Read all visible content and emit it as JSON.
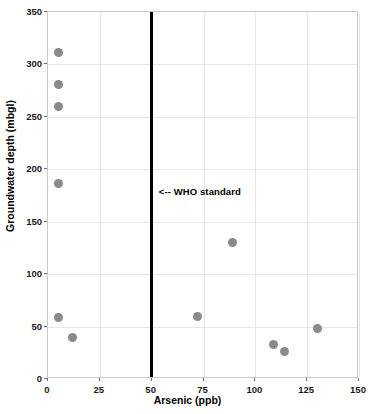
{
  "chart_data": {
    "type": "scatter",
    "title": "",
    "xlabel": "Arsenic (ppb)",
    "ylabel": "Groundwater depth (mbgl)",
    "xlim": [
      0,
      150
    ],
    "ylim": [
      0,
      350
    ],
    "xticks": [
      0,
      25,
      50,
      75,
      100,
      125,
      150
    ],
    "yticks": [
      0,
      50,
      100,
      150,
      200,
      250,
      300,
      350
    ],
    "xtick_labels": [
      "0",
      "25",
      "50",
      "75",
      "100",
      "125",
      "150"
    ],
    "ytick_labels": [
      "0",
      "50",
      "100",
      "150",
      "200",
      "250",
      "300",
      "350"
    ],
    "grid": true,
    "legend": false,
    "marker_color": "#8a8a8a",
    "points": [
      {
        "x": 5,
        "y": 311
      },
      {
        "x": 5,
        "y": 281
      },
      {
        "x": 5,
        "y": 260
      },
      {
        "x": 5,
        "y": 186
      },
      {
        "x": 5,
        "y": 59
      },
      {
        "x": 12,
        "y": 40
      },
      {
        "x": 72,
        "y": 60
      },
      {
        "x": 89,
        "y": 130
      },
      {
        "x": 109,
        "y": 33
      },
      {
        "x": 114,
        "y": 26
      },
      {
        "x": 130,
        "y": 48
      }
    ],
    "annotations": [
      {
        "text": "<-- WHO standard",
        "x": 52,
        "y": 178,
        "color": "#000000"
      }
    ],
    "reference_lines": [
      {
        "orientation": "vertical",
        "value": 50,
        "color": "#000000",
        "width_px": 3,
        "label": "WHO standard"
      }
    ]
  }
}
